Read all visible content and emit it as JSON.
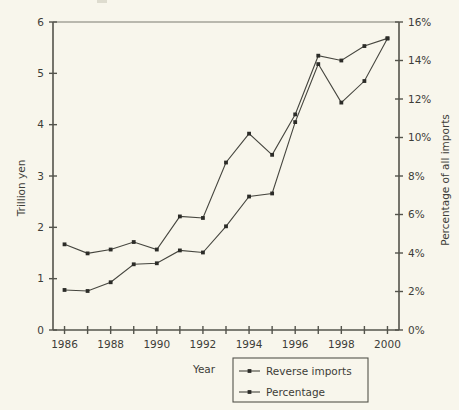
{
  "chart_data": {
    "type": "line",
    "title": "",
    "xlabel": "Year",
    "ylabel": "Trillion yen",
    "y2label": "Percentage of all imports",
    "x": [
      1986,
      1987,
      1988,
      1989,
      1990,
      1991,
      1992,
      1993,
      1994,
      1995,
      1996,
      1997,
      1998,
      1999,
      2000
    ],
    "categories": [
      "1986",
      "1987",
      "1988",
      "1989",
      "1990",
      "1991",
      "1992",
      "1993",
      "1994",
      "1995",
      "1996",
      "1997",
      "1998",
      "1999",
      "2000"
    ],
    "xtick_labels": [
      "1986",
      "",
      "1988",
      "",
      "1990",
      "",
      "1992",
      "",
      "1994",
      "",
      "1996",
      "",
      "1998",
      "",
      "2000"
    ],
    "xlim": [
      1985.5,
      2000.5
    ],
    "ylim": [
      0,
      6
    ],
    "ytick_labels": [
      "0",
      "1",
      "2",
      "3",
      "4",
      "5",
      "6"
    ],
    "ytick_values": [
      0,
      1,
      2,
      3,
      4,
      5,
      6
    ],
    "y2lim": [
      0,
      16
    ],
    "y2tick_labels": [
      "0%",
      "2%",
      "4%",
      "6%",
      "8%",
      "10%",
      "12%",
      "14%",
      "16%"
    ],
    "y2tick_values": [
      0,
      2,
      4,
      6,
      8,
      10,
      12,
      14,
      16
    ],
    "grid": false,
    "legend_position": "bottom-center",
    "series": [
      {
        "name": "Reverse imports",
        "axis": "left",
        "unit": "Trillion yen",
        "values": [
          0.78,
          0.76,
          0.93,
          1.28,
          1.3,
          1.55,
          1.51,
          2.02,
          2.6,
          2.66,
          4.05,
          5.18,
          4.43,
          4.85,
          5.68
        ]
      },
      {
        "name": "Percentage",
        "axis": "right",
        "unit": "Percentage of all imports",
        "values": [
          4.45,
          3.98,
          4.18,
          4.57,
          4.18,
          5.9,
          5.82,
          8.7,
          10.2,
          9.1,
          11.2,
          14.25,
          14.0,
          14.75,
          15.15
        ]
      }
    ]
  },
  "legend": {
    "items": [
      {
        "label": "Reverse imports"
      },
      {
        "label": "Percentage"
      }
    ]
  },
  "colors": {
    "background": "#f8f6ec",
    "axis": "#54544c",
    "series_line": "#46463f",
    "marker": "#2c2c28",
    "text": "#3d3d38"
  }
}
